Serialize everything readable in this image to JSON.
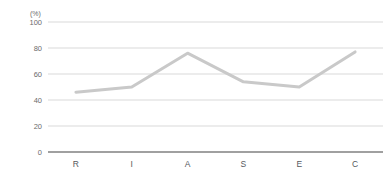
{
  "chart_data": {
    "type": "line",
    "title": "",
    "subtitle": "",
    "xlabel": "",
    "ylabel": "",
    "unit_label": "(%)",
    "categories": [
      "R",
      "I",
      "A",
      "S",
      "E",
      "C"
    ],
    "values": [
      46,
      50,
      76,
      54,
      50,
      77
    ],
    "series": [
      {
        "name": "",
        "values": [
          46,
          50,
          76,
          54,
          50,
          77
        ]
      }
    ],
    "ylim": [
      0,
      100
    ],
    "y_ticks": [
      0,
      20,
      40,
      60,
      80,
      100
    ],
    "y_tick_labels": [
      "0",
      "20",
      "40",
      "60",
      "80",
      "100"
    ],
    "x_tick_labels": [
      "R",
      "I",
      "A",
      "S",
      "E",
      "C"
    ],
    "grid": true,
    "grid_axis": "y",
    "legend": false,
    "legend_position": "none",
    "markers": false,
    "colors": {
      "line": "#c9c9c9",
      "gridline": "#d9d9d9",
      "baseline": "#808080",
      "tick_text": "#6b6b6b",
      "category_text": "#55595c",
      "background": "#ffffff"
    },
    "line_width": 3
  }
}
